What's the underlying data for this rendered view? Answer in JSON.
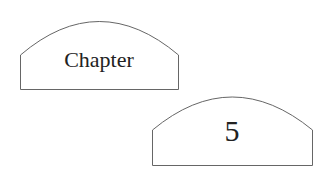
{
  "shapes": [
    {
      "label": "Chapter"
    },
    {
      "label": "5"
    }
  ],
  "colors": {
    "stroke": "#666666",
    "text": "#222222",
    "background": "#ffffff"
  }
}
